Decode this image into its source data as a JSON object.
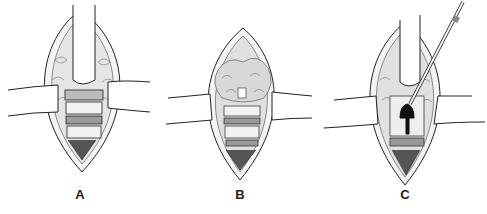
{
  "figure": {
    "panels": [
      {
        "id": "A",
        "label": "A",
        "content": "Incision with vertical and horizontal retractors exposing stacked vertebral/disc segments"
      },
      {
        "id": "B",
        "label": "B",
        "content": "Incision with horizontal retractors, tissue mass exposed above layered segments"
      },
      {
        "id": "C",
        "label": "C",
        "content": "Incision with retractors and a probe instrument inserted into a dark opening"
      }
    ],
    "colors": {
      "background": "#ffffff",
      "ink": "#222222",
      "tissue_fill": "#e8e8e8",
      "shadow": "#111111"
    }
  }
}
